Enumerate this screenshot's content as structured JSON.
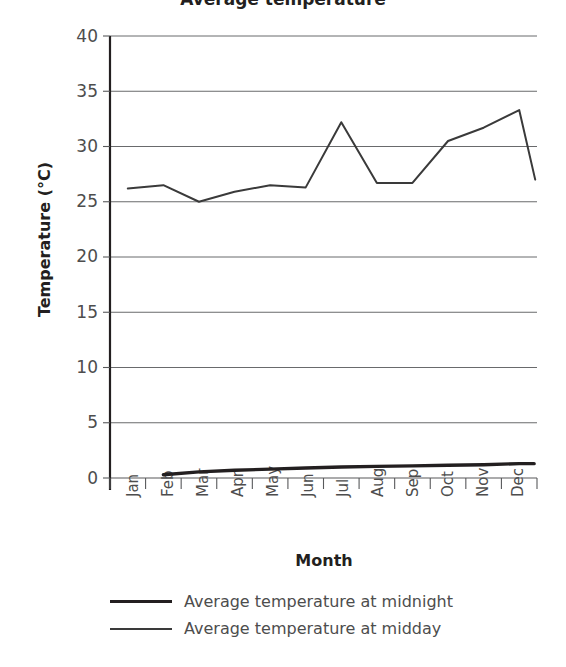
{
  "chart_data": {
    "type": "line",
    "title": "Average temperature",
    "xlabel": "Month",
    "ylabel": "Temperature (°C)",
    "categories": [
      "Jan",
      "Feb",
      "Mar",
      "Apr",
      "May",
      "Jun",
      "Jul",
      "Aug",
      "Sep",
      "Oct",
      "Nov",
      "Dec"
    ],
    "ylim": [
      0,
      40
    ],
    "yticks": [
      0,
      5,
      10,
      15,
      20,
      25,
      30,
      35,
      40
    ],
    "grid": "horizontal",
    "legend_position": "bottom",
    "series": [
      {
        "name": "Average temperature at midnight",
        "values": [
          null,
          0.3,
          0.55,
          0.7,
          0.8,
          0.9,
          1.0,
          1.05,
          1.1,
          1.15,
          1.2,
          1.3
        ],
        "color": "#231f20",
        "width": 3.4
      },
      {
        "name": "Average temperature at midday",
        "values": [
          26.2,
          26.5,
          25.0,
          25.9,
          26.5,
          26.3,
          32.2,
          26.7,
          26.7,
          30.5,
          31.7,
          33.3
        ],
        "color": "#3a3a3a",
        "width": 2.0,
        "end_drop": 27.0
      }
    ]
  },
  "axes": {
    "y_title": "Temperature (°C)",
    "x_title": "Month",
    "y_ticks": [
      "40",
      "35",
      "30",
      "25",
      "20",
      "15",
      "10",
      "5",
      "0"
    ],
    "x_ticks": [
      "Jan",
      "Feb",
      "Mar",
      "Apr",
      "May",
      "Jun",
      "Jul",
      "Aug",
      "Sep",
      "Oct",
      "Nov",
      "Dec"
    ]
  },
  "legend": {
    "items": [
      {
        "label": "Average temperature at midnight"
      },
      {
        "label": "Average temperature at midday"
      }
    ]
  }
}
